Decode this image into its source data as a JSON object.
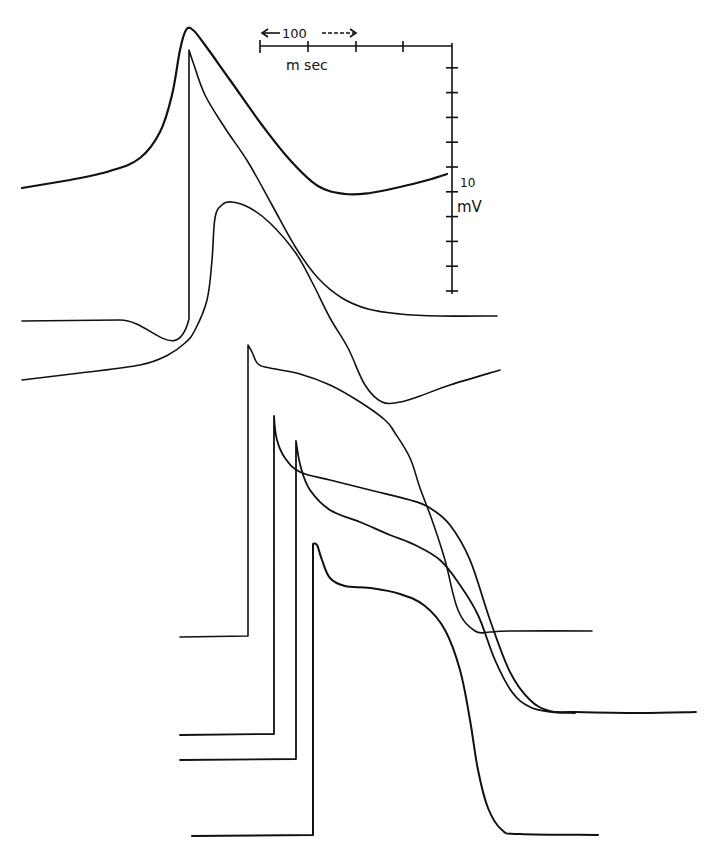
{
  "chart_data": {
    "type": "line",
    "title": "",
    "xlabel": "",
    "ylabel": "",
    "grid": false,
    "legend": "none",
    "scale_bars": {
      "time": {
        "label_value": "100",
        "label_unit": "m sec",
        "divisions": 4,
        "px_per_division": 48,
        "msec_per_division": 100
      },
      "voltage": {
        "label_value": "10",
        "label_unit": "mV",
        "divisions": 10,
        "px_per_division": 24.8,
        "mv_per_division": 10
      }
    },
    "series": [
      {
        "name": "trace-1",
        "stroke_width": 2.2,
        "baseline_y": 188,
        "upstroke": "slow",
        "points": [
          [
            22,
            188
          ],
          [
            70,
            180
          ],
          [
            110,
            171
          ],
          [
            140,
            158
          ],
          [
            160,
            132
          ],
          [
            172,
            95
          ],
          [
            180,
            50
          ],
          [
            186,
            30
          ],
          [
            193,
            30
          ],
          [
            205,
            45
          ],
          [
            230,
            80
          ],
          [
            262,
            125
          ],
          [
            290,
            160
          ],
          [
            318,
            186
          ],
          [
            345,
            194
          ],
          [
            370,
            193
          ],
          [
            400,
            187
          ],
          [
            428,
            180
          ],
          [
            447,
            174
          ]
        ]
      },
      {
        "name": "trace-2",
        "stroke_width": 1.6,
        "baseline_y": 320,
        "upstroke": "fast",
        "points": [
          [
            22,
            321
          ],
          [
            120,
            320
          ],
          [
            189,
            319
          ],
          [
            189,
            50
          ],
          [
            193,
            62
          ],
          [
            205,
            95
          ],
          [
            225,
            128
          ],
          [
            248,
            162
          ],
          [
            272,
            205
          ],
          [
            296,
            248
          ],
          [
            318,
            278
          ],
          [
            342,
            298
          ],
          [
            368,
            309
          ],
          [
            400,
            314
          ],
          [
            440,
            316
          ],
          [
            497,
            316
          ]
        ]
      },
      {
        "name": "trace-3",
        "stroke_width": 1.6,
        "baseline_y": 370,
        "upstroke": "slow",
        "points": [
          [
            22,
            380
          ],
          [
            80,
            373
          ],
          [
            140,
            365
          ],
          [
            168,
            355
          ],
          [
            185,
            343
          ],
          [
            195,
            330
          ],
          [
            207,
            300
          ],
          [
            212,
            260
          ],
          [
            215,
            218
          ],
          [
            222,
            205
          ],
          [
            232,
            202
          ],
          [
            250,
            208
          ],
          [
            270,
            223
          ],
          [
            295,
            252
          ],
          [
            312,
            282
          ],
          [
            330,
            318
          ],
          [
            348,
            348
          ],
          [
            365,
            385
          ],
          [
            382,
            402
          ],
          [
            400,
            402
          ],
          [
            420,
            396
          ],
          [
            450,
            385
          ],
          [
            500,
            370
          ]
        ]
      },
      {
        "name": "trace-4",
        "stroke_width": 1.6,
        "baseline_y": 636,
        "upstroke": "fast",
        "points": [
          [
            180,
            637
          ],
          [
            248,
            636
          ],
          [
            248,
            345
          ],
          [
            252,
            352
          ],
          [
            258,
            364
          ],
          [
            270,
            368
          ],
          [
            300,
            374
          ],
          [
            330,
            385
          ],
          [
            360,
            402
          ],
          [
            385,
            420
          ],
          [
            395,
            433
          ],
          [
            410,
            458
          ],
          [
            420,
            488
          ],
          [
            432,
            520
          ],
          [
            445,
            560
          ],
          [
            458,
            610
          ],
          [
            475,
            631
          ],
          [
            490,
            632
          ],
          [
            510,
            631
          ],
          [
            592,
            631
          ]
        ]
      },
      {
        "name": "trace-5",
        "stroke_width": 1.8,
        "baseline_y": 734,
        "upstroke": "fast",
        "points": [
          [
            180,
            735
          ],
          [
            274,
            734
          ],
          [
            274,
            416
          ],
          [
            277,
            440
          ],
          [
            285,
            458
          ],
          [
            300,
            472
          ],
          [
            330,
            480
          ],
          [
            370,
            490
          ],
          [
            410,
            500
          ],
          [
            430,
            508
          ],
          [
            450,
            525
          ],
          [
            470,
            560
          ],
          [
            490,
            620
          ],
          [
            510,
            672
          ],
          [
            530,
            700
          ],
          [
            550,
            711
          ],
          [
            575,
            712
          ],
          [
            640,
            713
          ],
          [
            696,
            712
          ]
        ]
      },
      {
        "name": "trace-6",
        "stroke_width": 1.8,
        "baseline_y": 759,
        "upstroke": "fast",
        "points": [
          [
            180,
            760
          ],
          [
            296,
            759
          ],
          [
            296,
            441
          ],
          [
            301,
            468
          ],
          [
            310,
            490
          ],
          [
            330,
            510
          ],
          [
            360,
            522
          ],
          [
            390,
            535
          ],
          [
            415,
            545
          ],
          [
            440,
            560
          ],
          [
            460,
            585
          ],
          [
            478,
            615
          ],
          [
            495,
            660
          ],
          [
            512,
            692
          ],
          [
            530,
            707
          ],
          [
            552,
            712
          ],
          [
            575,
            713
          ]
        ]
      },
      {
        "name": "trace-7",
        "stroke_width": 2.0,
        "baseline_y": 835,
        "upstroke": "fast",
        "points": [
          [
            192,
            836
          ],
          [
            313,
            835
          ],
          [
            313,
            544
          ],
          [
            317,
            545
          ],
          [
            322,
            560
          ],
          [
            330,
            578
          ],
          [
            345,
            586
          ],
          [
            370,
            588
          ],
          [
            400,
            594
          ],
          [
            425,
            606
          ],
          [
            445,
            630
          ],
          [
            460,
            670
          ],
          [
            470,
            720
          ],
          [
            478,
            770
          ],
          [
            488,
            808
          ],
          [
            502,
            830
          ],
          [
            520,
            834
          ],
          [
            598,
            835
          ]
        ]
      }
    ]
  },
  "scale": {
    "time_value": "100",
    "time_unit": "m sec",
    "volt_value": "10",
    "volt_unit": "mV"
  }
}
